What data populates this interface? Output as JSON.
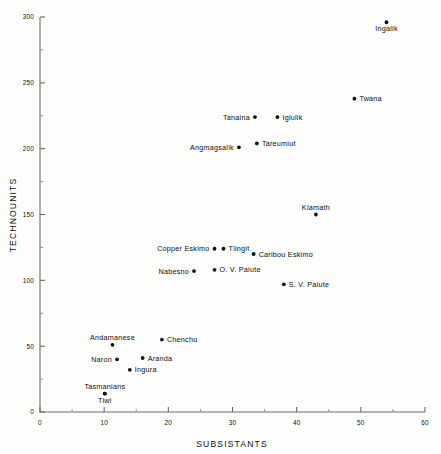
{
  "chart_data": {
    "type": "scatter",
    "title": "",
    "xlabel": "SUBSISTANTS",
    "ylabel": "TECHNOUNITS",
    "xlim": [
      0,
      60
    ],
    "ylim": [
      0,
      300
    ],
    "xticks": [
      0,
      10,
      20,
      30,
      40,
      50,
      60
    ],
    "yticks": [
      0,
      50,
      100,
      150,
      200,
      250,
      300
    ],
    "xtick_labels": [
      "0",
      "10",
      "20",
      "30",
      "40",
      "50",
      "60"
    ],
    "ytick_labels": [
      "0",
      "50",
      "100",
      "150",
      "200",
      "250",
      "300"
    ],
    "minor_tick_step_x": 5,
    "minor_tick_step_y": 25,
    "grid": false,
    "legend": null,
    "marker": "filled-circle",
    "marker_color": "#111111",
    "points": [
      {
        "label": "Ingalik",
        "x": 54.0,
        "y": 296,
        "label_pos": "below"
      },
      {
        "label": "Twana",
        "x": 49.0,
        "y": 238,
        "label_pos": "right"
      },
      {
        "label": "Tanaina",
        "x": 33.5,
        "y": 224,
        "label_pos": "left"
      },
      {
        "label": "Iglulik",
        "x": 37.0,
        "y": 224,
        "label_pos": "right"
      },
      {
        "label": "Angmagsalik",
        "x": 31.0,
        "y": 201,
        "label_pos": "left"
      },
      {
        "label": "Tareumiut",
        "x": 33.8,
        "y": 204,
        "label_pos": "right"
      },
      {
        "label": "Klamath",
        "x": 43.0,
        "y": 150,
        "label_pos": "above"
      },
      {
        "label": "Copper Eskimo",
        "x": 27.2,
        "y": 124,
        "label_pos": "left"
      },
      {
        "label": "Tlingit",
        "x": 28.6,
        "y": 124,
        "label_pos": "right"
      },
      {
        "label": "Caribou Eskimo",
        "x": 33.3,
        "y": 120,
        "label_pos": "right"
      },
      {
        "label": "Nabesno",
        "x": 24.0,
        "y": 107,
        "label_pos": "left"
      },
      {
        "label": "O. V. Paiute",
        "x": 27.2,
        "y": 108,
        "label_pos": "right"
      },
      {
        "label": "S. V. Paiute",
        "x": 38.0,
        "y": 97,
        "label_pos": "right"
      },
      {
        "label": "Chenchu",
        "x": 19.0,
        "y": 55,
        "label_pos": "right"
      },
      {
        "label": "Andamanese",
        "x": 11.3,
        "y": 51,
        "label_pos": "above"
      },
      {
        "label": "Aranda",
        "x": 16.0,
        "y": 41,
        "label_pos": "right"
      },
      {
        "label": "Naron",
        "x": 12.0,
        "y": 40,
        "label_pos": "left"
      },
      {
        "label": "Ingura",
        "x": 14.0,
        "y": 32,
        "label_pos": "right"
      },
      {
        "label": "Tasmanians",
        "x": 10.1,
        "y": 14,
        "label_pos": "above"
      },
      {
        "label": "Tiwi",
        "x": 10.1,
        "y": 14,
        "label_pos": "below"
      }
    ]
  }
}
